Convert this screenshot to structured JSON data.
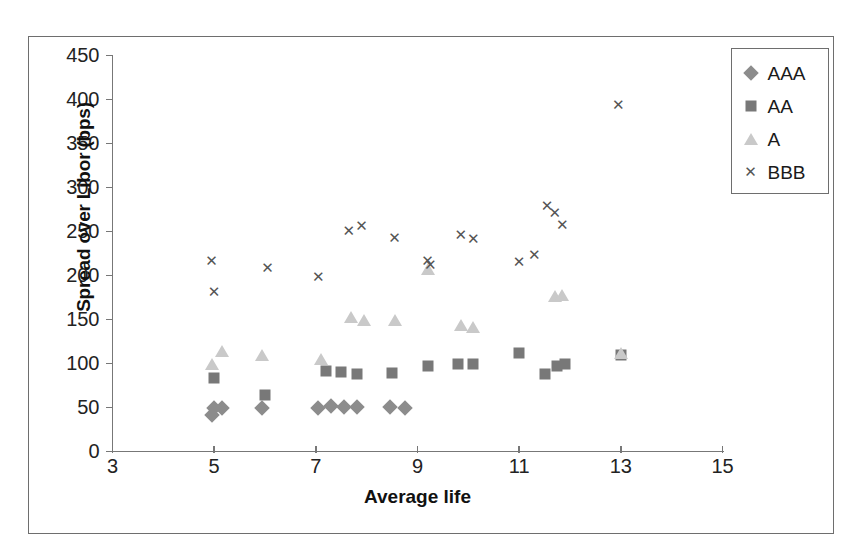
{
  "chart_data": {
    "type": "scatter",
    "title": "",
    "xlabel": "Average life",
    "ylabel": "Spread over Libor (bps)",
    "xlim": [
      3,
      15
    ],
    "ylim": [
      0,
      450
    ],
    "xticks": [
      3,
      5,
      7,
      9,
      11,
      13,
      15
    ],
    "yticks": [
      0,
      50,
      100,
      150,
      200,
      250,
      300,
      350,
      400,
      450
    ],
    "grid": false,
    "legend_position": "top-right",
    "series": [
      {
        "name": "AAA",
        "marker": "diamond",
        "color": "#8c8c8c",
        "points": [
          [
            4.95,
            41
          ],
          [
            5.0,
            50
          ],
          [
            5.15,
            49
          ],
          [
            5.95,
            50
          ],
          [
            7.05,
            49
          ],
          [
            7.3,
            52
          ],
          [
            7.55,
            51
          ],
          [
            7.8,
            51
          ],
          [
            8.45,
            51
          ],
          [
            8.75,
            50
          ]
        ]
      },
      {
        "name": "AA",
        "marker": "square",
        "color": "#787878",
        "points": [
          [
            5.0,
            84
          ],
          [
            6.0,
            64
          ],
          [
            7.2,
            91
          ],
          [
            7.5,
            90
          ],
          [
            7.8,
            88
          ],
          [
            8.5,
            89
          ],
          [
            9.2,
            97
          ],
          [
            9.8,
            100
          ],
          [
            10.1,
            100
          ],
          [
            11.0,
            112
          ],
          [
            11.5,
            88
          ],
          [
            11.75,
            97
          ],
          [
            11.9,
            100
          ],
          [
            13.0,
            110
          ]
        ]
      },
      {
        "name": "A",
        "marker": "triangle",
        "color": "#c9c9c9",
        "points": [
          [
            4.95,
            99
          ],
          [
            5.15,
            114
          ],
          [
            5.95,
            110
          ],
          [
            7.1,
            105
          ],
          [
            7.7,
            153
          ],
          [
            7.95,
            150
          ],
          [
            8.55,
            150
          ],
          [
            9.2,
            207
          ],
          [
            9.85,
            144
          ],
          [
            10.1,
            141
          ],
          [
            11.7,
            177
          ],
          [
            11.85,
            178
          ],
          [
            13.0,
            112
          ]
        ]
      },
      {
        "name": "BBB",
        "marker": "x",
        "color": "#555555",
        "points": [
          [
            4.95,
            217
          ],
          [
            5.0,
            181
          ],
          [
            6.05,
            208
          ],
          [
            7.05,
            198
          ],
          [
            7.65,
            251
          ],
          [
            7.9,
            256
          ],
          [
            8.55,
            243
          ],
          [
            9.2,
            216
          ],
          [
            9.25,
            212
          ],
          [
            9.85,
            246
          ],
          [
            10.1,
            242
          ],
          [
            11.0,
            215
          ],
          [
            11.3,
            223
          ],
          [
            11.55,
            279
          ],
          [
            11.7,
            271
          ],
          [
            11.85,
            257
          ],
          [
            12.95,
            394
          ]
        ]
      }
    ]
  },
  "legend": {
    "items": [
      {
        "label": "AAA",
        "marker": "diamond"
      },
      {
        "label": "AA",
        "marker": "square"
      },
      {
        "label": "A",
        "marker": "triangle"
      },
      {
        "label": "BBB",
        "marker": "x"
      }
    ]
  },
  "axes": {
    "y_title": "Spread over Libor (bps)",
    "x_title": "Average life",
    "y_tick_labels": [
      "450",
      "400",
      "350",
      "300",
      "250",
      "200",
      "150",
      "100",
      "50",
      "0"
    ],
    "x_tick_labels": [
      "3",
      "5",
      "7",
      "9",
      "11",
      "13",
      "15"
    ]
  },
  "caption": "",
  "marker_glyphs": {
    "x": "✕"
  }
}
